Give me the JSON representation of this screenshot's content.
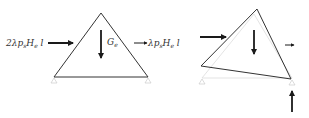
{
  "diagram": {
    "panels": [
      {
        "id": "undeformed",
        "shape": "triangle",
        "labels": {
          "left_force": {
            "prefix": "2λp",
            "sub1": "s",
            "mid": "H",
            "sub2": "e",
            "suffix": " l"
          },
          "gravity": {
            "main": "G",
            "sub": "e"
          },
          "right_force": {
            "prefix": "λp",
            "sub1": "s",
            "mid": "H",
            "sub2": "e",
            "suffix": " l"
          }
        },
        "supports": [
          "pin-left",
          "pin-right"
        ]
      },
      {
        "id": "deformed",
        "shape": "rotated-triangle",
        "arrows": [
          "horizontal-load",
          "gravity-load",
          "small-horizontal-load",
          "reaction-up"
        ],
        "supports": [
          "pin-left",
          "pin-right"
        ]
      }
    ],
    "colors": {
      "line": "#333333",
      "faint": "#cfcfcf",
      "arrow": "#1a1a1a"
    }
  }
}
